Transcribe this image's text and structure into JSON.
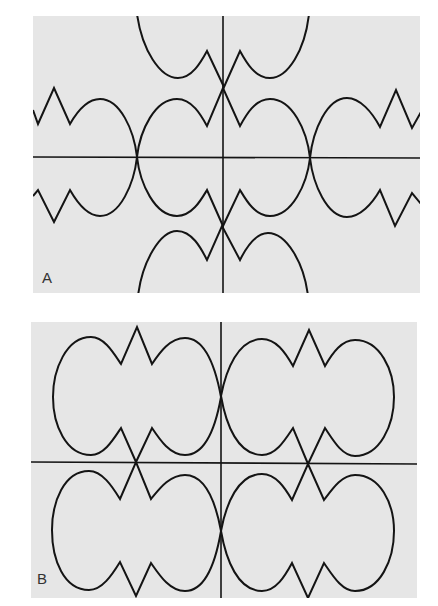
{
  "figure": {
    "panels": [
      {
        "id": "A",
        "label": "A",
        "bbox": {
          "x": 33,
          "y": 16,
          "w": 387,
          "h": 277
        },
        "background": "#e6e6e6",
        "axes": {
          "vertical_x": 223,
          "horizontal_y": 157
        },
        "description": "Rows of lobed closed curves with zigzag cusps, symmetric about both axes; lobes cross on horizontal axis at x=137 and x=310"
      },
      {
        "id": "B",
        "label": "B",
        "bbox": {
          "x": 31,
          "y": 322,
          "w": 386,
          "h": 276
        },
        "background": "#e6e6e6",
        "axes": {
          "vertical_x": 221,
          "horizontal_y": 463
        },
        "description": "Four closed double-lobed curves with zigzag notches, one per quadrant; lobes touch at the vertical axis and cross at the horizontal axis"
      }
    ],
    "colors": {
      "stroke": "#141414",
      "panel_background": "#e6e6e6",
      "page_background": "#ffffff",
      "label": "#333333"
    }
  }
}
